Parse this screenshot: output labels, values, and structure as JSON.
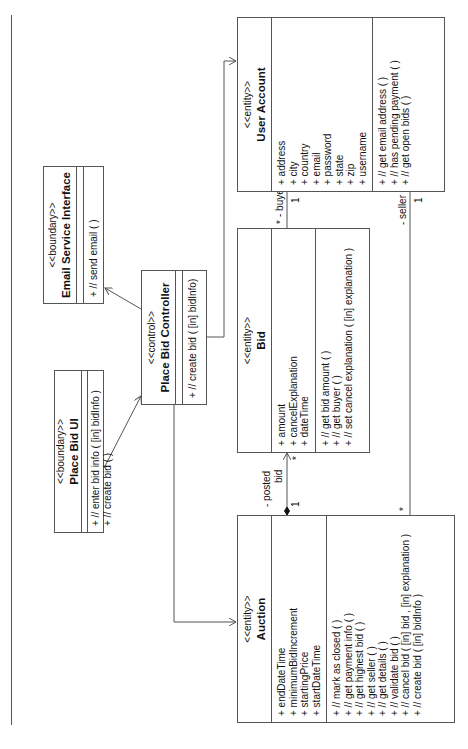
{
  "diagram": {
    "type": "UML class diagram (rotated 90 degrees counter-clockwise)",
    "classes": {
      "user_account": {
        "stereotype": "<<entity>>",
        "name": "User Account",
        "attributes": [
          "+ address",
          "+ city",
          "+ country",
          "+ email",
          "+ password",
          "+ state",
          "+ zip",
          "+ username"
        ],
        "operations": [
          "+ // get email address ( )",
          "+ // has pending payment ( )",
          "+ // get open bids ( )"
        ]
      },
      "bid": {
        "stereotype": "<<entity>>",
        "name": "Bid",
        "attributes": [
          "+ amount",
          "+ cancelExplanation",
          "+ dateTime"
        ],
        "operations": [
          "+ // get bid amount ( )",
          "+ // get buyer ( )",
          "+ // set cancel explanation ( [in] explanation )"
        ]
      },
      "auction": {
        "stereotype": "<<entity>>",
        "name": "Auction",
        "attributes": [
          "+ endDateTime",
          "+ minimumBidIncrement",
          "+ startingPrice",
          "+ startDateTime"
        ],
        "operations": [
          "+ // mark as closed ( )",
          "+ // get payment info ( )",
          "+ // get highest bid ( )",
          "+ // get seller ( )",
          "+ // get details ( )",
          "+ // validate bid ( )",
          "+ // cancel bid ( [in] bid , [in] explanation )",
          "+ // create bid ( [in] bidInfo )"
        ]
      },
      "controller": {
        "stereotype": "<<control>>",
        "name": "Place Bid Controller",
        "attributes": [],
        "operations": [
          "+ // create bid ( [in] bidInfo)"
        ]
      },
      "email": {
        "stereotype": "<<boundary>>",
        "name": "Email Service Interface",
        "attributes": [],
        "operations": [
          "+ // send email ( )"
        ]
      },
      "ui": {
        "stereotype": "<<boundary>>",
        "name": "Place Bid UI",
        "attributes": [],
        "operations": [
          "+ // enter bid info ( [in] bidInfo )",
          "+ // create bid ( )"
        ]
      }
    },
    "associations": {
      "buyer_role": "- buyer",
      "buyer_mult_account": "1",
      "buyer_mult_bid": "*",
      "seller_role": "- seller",
      "seller_mult_account": "1",
      "seller_mult_auction": "*",
      "posted_role_1": "- posted",
      "posted_role_2": "bid",
      "posted_mult_auction": "1",
      "posted_mult_bid": "*"
    }
  }
}
